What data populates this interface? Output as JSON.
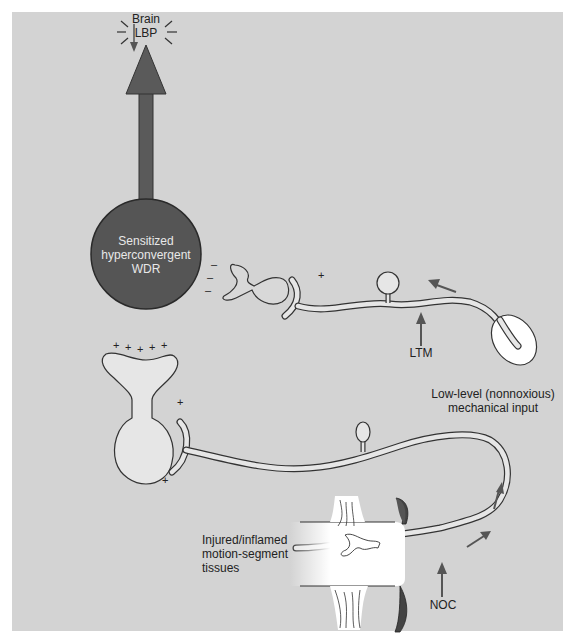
{
  "diagram": {
    "top_label": {
      "line1": "Brain",
      "line2": "LBP"
    },
    "wdr_neuron": {
      "line1": "Sensitized",
      "line2": "hyperconvergent",
      "line3": "WDR"
    },
    "ltm_label": "LTM",
    "noc_label": "NOC",
    "mechanical_input": {
      "line1": "Low-level (nonnoxious)",
      "line2": "mechanical input"
    },
    "tissue_label": {
      "line1": "Injured/inflamed",
      "line2": "motion-segment",
      "line3": "tissues"
    },
    "signs": {
      "minus": "–",
      "plus": "+"
    },
    "colors": {
      "background": "#d3d3d3",
      "wdr_fill": "#555555",
      "arrow_fill": "#5a5a5a",
      "neuron_fill": "#e6e6e6",
      "outline": "#333333",
      "tissue_fill": "#ffffff"
    }
  }
}
